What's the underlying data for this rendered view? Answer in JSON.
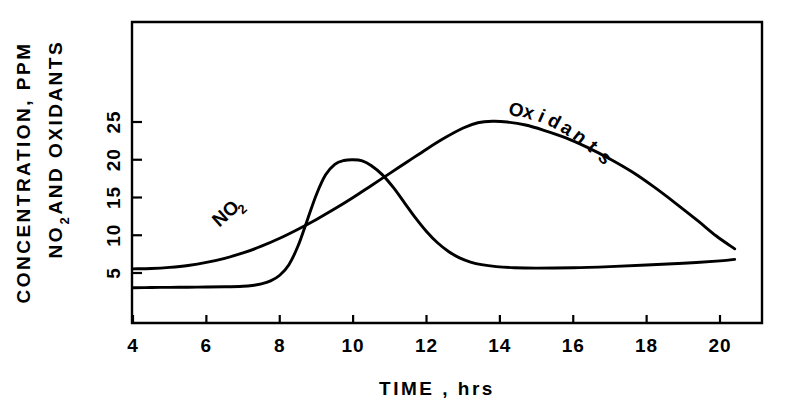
{
  "chart_data": {
    "type": "line",
    "title": "",
    "xlabel": "TIME , hrs",
    "ylabel_line1": "CONCENTRATION, PPM",
    "ylabel_line2_main": "NO",
    "ylabel_line2_sub": "2",
    "ylabel_line2_tail": " AND OXIDANTS",
    "xlim": [
      3.5,
      20.6
    ],
    "ylim": [
      0,
      29
    ],
    "xticks": [
      4,
      6,
      8,
      10,
      12,
      14,
      16,
      18,
      20
    ],
    "xtick_labels": [
      "4",
      "6",
      "8",
      "10",
      "12",
      "14",
      "16",
      "18",
      "20"
    ],
    "yticks": [
      5,
      10,
      15,
      20,
      25
    ],
    "ytick_labels": [
      "5",
      "10",
      "15",
      "20",
      "25"
    ],
    "grid": false,
    "legend_position": "inline-on-curve",
    "series": [
      {
        "name": "NO2",
        "label_main": "NO",
        "label_sub": "2",
        "label_rotation": -42,
        "label_x": 6.35,
        "label_y": 11.0,
        "points": [
          [
            4.0,
            3.05
          ],
          [
            4.5,
            3.08
          ],
          [
            5.0,
            3.1
          ],
          [
            5.5,
            3.12
          ],
          [
            6.0,
            3.15
          ],
          [
            6.5,
            3.18
          ],
          [
            7.0,
            3.25
          ],
          [
            7.25,
            3.35
          ],
          [
            7.5,
            3.55
          ],
          [
            7.75,
            3.95
          ],
          [
            8.0,
            4.7
          ],
          [
            8.25,
            6.1
          ],
          [
            8.5,
            8.6
          ],
          [
            8.75,
            12.0
          ],
          [
            9.0,
            15.4
          ],
          [
            9.25,
            18.0
          ],
          [
            9.5,
            19.4
          ],
          [
            9.75,
            19.9
          ],
          [
            10.0,
            20.0
          ],
          [
            10.25,
            19.85
          ],
          [
            10.5,
            19.2
          ],
          [
            10.8,
            18.0
          ],
          [
            11.1,
            16.3
          ],
          [
            11.4,
            14.3
          ],
          [
            11.7,
            12.3
          ],
          [
            12.0,
            10.5
          ],
          [
            12.3,
            9.0
          ],
          [
            12.6,
            7.85
          ],
          [
            12.9,
            7.0
          ],
          [
            13.2,
            6.45
          ],
          [
            13.5,
            6.1
          ],
          [
            13.9,
            5.85
          ],
          [
            14.4,
            5.7
          ],
          [
            15.0,
            5.65
          ],
          [
            16.0,
            5.7
          ],
          [
            17.0,
            5.85
          ],
          [
            18.0,
            6.05
          ],
          [
            19.0,
            6.3
          ],
          [
            20.0,
            6.6
          ],
          [
            20.4,
            6.8
          ]
        ]
      },
      {
        "name": "Oxidants",
        "label_main": "Oxidants",
        "label_rotation": 22,
        "label_x": 14.4,
        "label_y": 25.8,
        "points": [
          [
            4.0,
            5.55
          ],
          [
            4.5,
            5.6
          ],
          [
            5.0,
            5.75
          ],
          [
            5.5,
            6.0
          ],
          [
            6.0,
            6.4
          ],
          [
            6.5,
            6.95
          ],
          [
            7.0,
            7.65
          ],
          [
            7.5,
            8.55
          ],
          [
            8.0,
            9.6
          ],
          [
            8.5,
            10.8
          ],
          [
            9.0,
            12.1
          ],
          [
            9.5,
            13.5
          ],
          [
            10.0,
            15.0
          ],
          [
            10.5,
            16.6
          ],
          [
            11.0,
            18.2
          ],
          [
            11.5,
            19.8
          ],
          [
            12.0,
            21.4
          ],
          [
            12.5,
            22.9
          ],
          [
            13.0,
            24.2
          ],
          [
            13.4,
            24.9
          ],
          [
            13.8,
            25.1
          ],
          [
            14.2,
            25.0
          ],
          [
            14.7,
            24.6
          ],
          [
            15.2,
            23.9
          ],
          [
            15.8,
            22.9
          ],
          [
            16.4,
            21.6
          ],
          [
            17.0,
            20.1
          ],
          [
            17.6,
            18.4
          ],
          [
            18.2,
            16.4
          ],
          [
            18.8,
            14.2
          ],
          [
            19.4,
            11.9
          ],
          [
            19.9,
            9.9
          ],
          [
            20.4,
            8.2
          ]
        ]
      }
    ]
  },
  "figure": {
    "background_color": "#ffffff",
    "line_color": "#000000"
  }
}
